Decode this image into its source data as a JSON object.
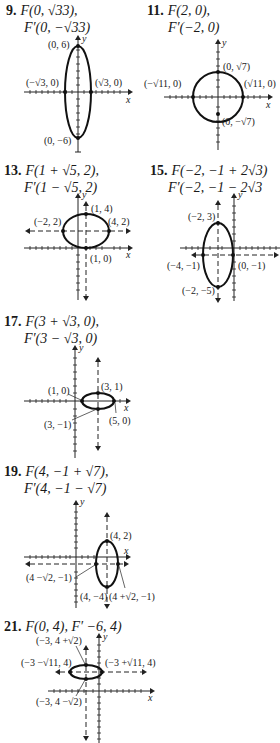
{
  "problems": [
    {
      "number": "9.",
      "line1": "F(0, √33),",
      "line2": "F′(0, −√33)",
      "labels": {
        "top": "(0, 6)",
        "bottom": "(0, −6)",
        "left": "(−√3, 0)",
        "right": "(√3, 0)"
      }
    },
    {
      "number": "11.",
      "line1": "F(2, 0),",
      "line2": "F′(−2, 0)",
      "labels": {
        "top": "(0, √7)",
        "bottom": "(0, −√7)",
        "left": "(−√11, 0)",
        "right": "(√11, 0)"
      }
    },
    {
      "number": "13.",
      "line1": "F(1 + √5, 2),",
      "line2": "F′(1 − √5, 2)",
      "labels": {
        "top": "(1, 4)",
        "bottom": "(1, 0)",
        "left": "(−2, 2)",
        "right": "(4, 2)"
      }
    },
    {
      "number": "15.",
      "line1": "F(−2, −1 + 2√3)",
      "line2": "F′(−2, −1 − 2√3",
      "labels": {
        "top": "(−2, 3)",
        "bottom": "(−2, −5)",
        "left": "(−4, −1)",
        "right": "(0, −1)"
      }
    },
    {
      "number": "17.",
      "line1": "F(3 + √3, 0),",
      "line2": "F′(3 − √3, 0)",
      "labels": {
        "top": "(3, 1)",
        "bottom": "(3, −1)",
        "left": "(1, 0)",
        "right": "(5, 0)"
      }
    },
    {
      "number": "19.",
      "line1": "F(4, −1 + √7),",
      "line2": "F′(4, −1 − √7)",
      "labels": {
        "top": "(4, 2)",
        "bottom": "(4, −4)",
        "left": "(4 −√2, −1)",
        "right": "(4 +√2, −1)"
      }
    },
    {
      "number": "21.",
      "line1": "F(0, 4), F′ −6, 4)",
      "line2": "",
      "labels": {
        "top": "(−3, 4 +√2)",
        "bottom": "(−3, 4 −√2)",
        "left": "(−3 −√11, 4)",
        "right": "(−3 +√11, 4)"
      }
    }
  ],
  "axis_labels": {
    "x": "x",
    "y": "y"
  }
}
